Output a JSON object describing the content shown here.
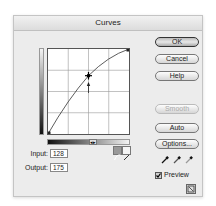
{
  "window": {
    "title": "Curves"
  },
  "curve": {
    "input": "128",
    "output": "175",
    "input_label": "Input:",
    "output_label": "Output:",
    "point": {
      "x": 128,
      "y": 175
    }
  },
  "buttons": {
    "ok": "OK",
    "cancel": "Cancel",
    "help": "Help",
    "smooth": "Smooth",
    "auto": "Auto",
    "options": "Options..."
  },
  "preview": {
    "label": "Preview",
    "checked": true
  },
  "icons": {
    "curve_mode": "curve-tool-icon",
    "pencil_mode": "pencil-tool-icon",
    "black_eyedropper": "eyedropper-icon",
    "gray_eyedropper": "eyedropper-icon",
    "white_eyedropper": "eyedropper-icon",
    "gradient_toggle": "◂▸",
    "resize": "expand-icon"
  }
}
